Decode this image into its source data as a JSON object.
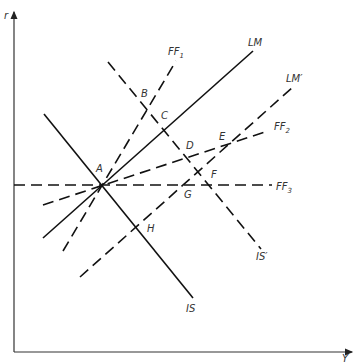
{
  "axes": {
    "y_label": "r",
    "x_label": "Y"
  },
  "curves": [
    {
      "id": "IS",
      "label": "IS",
      "style": "solid",
      "x1": 44,
      "y1": 114,
      "x2": 193,
      "y2": 298,
      "lx": 186,
      "ly": 312
    },
    {
      "id": "IS_prime",
      "label": "IS′",
      "style": "dashed",
      "x1": 108,
      "y1": 62,
      "x2": 261,
      "y2": 249,
      "lx": 256,
      "ly": 260
    },
    {
      "id": "LM",
      "label": "LM",
      "style": "solid",
      "x1": 43,
      "y1": 238,
      "x2": 253,
      "y2": 51,
      "lx": 248,
      "ly": 46
    },
    {
      "id": "LM_prime",
      "label": "LM′",
      "style": "dashed",
      "x1": 80,
      "y1": 277,
      "x2": 293,
      "y2": 87,
      "lx": 286,
      "ly": 82
    },
    {
      "id": "FF1",
      "label": "FF",
      "sub": "1",
      "style": "dashed",
      "x1": 63,
      "y1": 251,
      "x2": 176,
      "y2": 61,
      "lx": 168,
      "ly": 55
    },
    {
      "id": "FF2",
      "label": "FF",
      "sub": "2",
      "style": "dashed",
      "x1": 43,
      "y1": 205,
      "x2": 268,
      "y2": 131,
      "lx": 274,
      "ly": 130
    },
    {
      "id": "FF3",
      "label": "FF",
      "sub": "3",
      "style": "dashed",
      "x1": 14,
      "y1": 185,
      "x2": 272,
      "y2": 185,
      "lx": 276,
      "ly": 190
    }
  ],
  "points": [
    {
      "label": "A",
      "x": 96,
      "y": 172
    },
    {
      "label": "B",
      "x": 141,
      "y": 97
    },
    {
      "label": "C",
      "x": 161,
      "y": 119
    },
    {
      "label": "D",
      "x": 186,
      "y": 149
    },
    {
      "label": "E",
      "x": 219,
      "y": 140
    },
    {
      "label": "F",
      "x": 211,
      "y": 178
    },
    {
      "label": "G",
      "x": 184,
      "y": 198
    },
    {
      "label": "H",
      "x": 147,
      "y": 232
    }
  ]
}
